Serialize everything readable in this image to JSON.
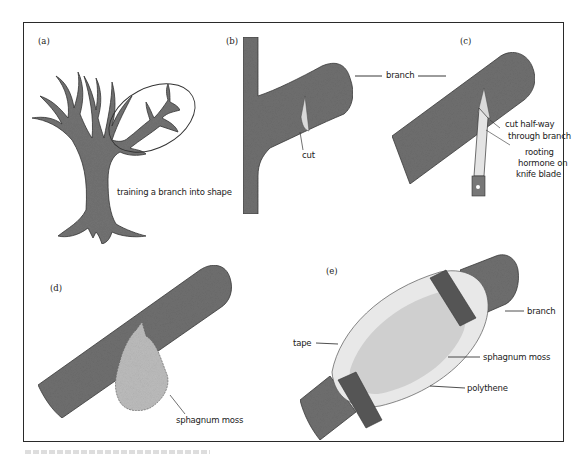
{
  "figure": {
    "panels": [
      {
        "id": "a",
        "letter": "(a)",
        "labels": {
          "training": "training a branch into shape"
        }
      },
      {
        "id": "b",
        "letter": "(b)",
        "labels": {
          "cut": "cut"
        }
      },
      {
        "id": "c",
        "letter": "(c)",
        "labels": {
          "cut_halfway_1": "cut half-way",
          "cut_halfway_2": "through branch",
          "rooting_1": "rooting",
          "rooting_2": "hormone on",
          "rooting_3": "knife blade"
        }
      },
      {
        "id": "d",
        "letter": "(d)",
        "labels": {
          "moss": "sphagnum moss"
        }
      },
      {
        "id": "e",
        "letter": "(e)",
        "labels": {
          "branch": "branch",
          "tape": "tape",
          "moss": "sphagnum moss",
          "polythene": "polythene"
        }
      }
    ],
    "shared_labels": {
      "branch": "branch"
    },
    "colors": {
      "bark": "#6f6f6f",
      "bark_edge": "#3a3a3a",
      "cut": "#d9d9d9",
      "moss": "#b9b9b9",
      "polythene": "#e6e6e6",
      "tape": "#555555",
      "frame": "#2a2a2a"
    }
  }
}
